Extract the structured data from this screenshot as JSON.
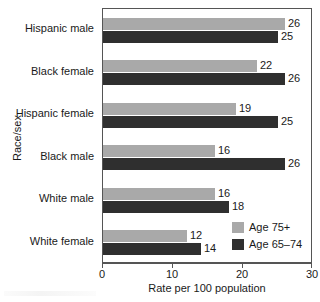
{
  "chart_data": {
    "type": "bar",
    "orientation": "horizontal",
    "title": "",
    "xlabel": "Rate per 100 population",
    "ylabel": "Race/sex",
    "xlim": [
      0,
      30
    ],
    "xticks": [
      0,
      10,
      20,
      30
    ],
    "grid": false,
    "legend_position": "inside-bottom-right",
    "categories": [
      "Hispanic male",
      "Black female",
      "Hispanic female",
      "Black male",
      "White male",
      "White female"
    ],
    "series": [
      {
        "name": "Age 75+",
        "color": "#a9a9a9",
        "values": [
          26,
          22,
          19,
          16,
          16,
          12
        ]
      },
      {
        "name": "Age 65-74",
        "color": "#2f2f2f",
        "values": [
          25,
          26,
          25,
          26,
          18,
          14
        ]
      }
    ]
  },
  "legend": {
    "items": [
      {
        "label": "Age 75+"
      },
      {
        "label": "Age 65–74"
      }
    ]
  }
}
